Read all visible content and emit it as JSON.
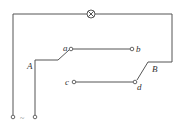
{
  "diagram": {
    "type": "circuit",
    "components": {
      "lamp": {
        "symbol": "⊗"
      },
      "source": {
        "symbol": "~"
      }
    },
    "labels": {
      "a": "a",
      "b": "b",
      "c": "c",
      "d": "d",
      "A": "A",
      "B": "B",
      "source": "~"
    },
    "colors": {
      "wire": "#555555",
      "background": "#ffffff"
    }
  }
}
